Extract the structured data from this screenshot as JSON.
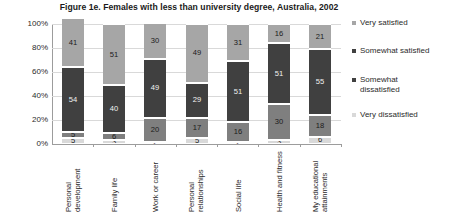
{
  "chart_data": {
    "type": "bar",
    "subtype": "stacked-bar-100-percent",
    "title": "Figure 1e. Females with less than university degree, Australia, 2002",
    "xlabel": "",
    "ylabel": "",
    "ylim": [
      0,
      100
    ],
    "yticks": [
      "0%",
      "20%",
      "40%",
      "60%",
      "80%",
      "100%"
    ],
    "ytick_values": [
      0,
      20,
      40,
      60,
      80,
      100
    ],
    "grid": true,
    "legend_position": "right",
    "categories": [
      "Personal\ndevelopment",
      "Family life",
      "Work or career",
      "Personal\nrelationships",
      "Social life",
      "Health and fitness",
      "My educational\nattainments"
    ],
    "series": [
      {
        "name": "Very satisfied",
        "color": "#a6a6a6",
        "values": [
          41,
          51,
          30,
          49,
          31,
          16,
          21
        ]
      },
      {
        "name": "Somewhat satisfied",
        "color": "#404040",
        "values": [
          54,
          40,
          49,
          29,
          51,
          51,
          55
        ]
      },
      {
        "name": "Somewhat dissatisfied",
        "color": "#7f7f7f",
        "values": [
          5,
          6,
          20,
          17,
          16,
          30,
          18
        ]
      },
      {
        "name": "Very dissatisfied",
        "color": "#d9d9d9",
        "values": [
          5,
          3,
          2,
          5,
          2,
          3,
          6
        ]
      }
    ]
  },
  "legend": {
    "entries": [
      {
        "label": "Very satisfied",
        "color": "#a6a6a6"
      },
      {
        "label": "Somewhat satisfied",
        "color": "#404040"
      },
      {
        "label": "Somewhat\ndissatisfied",
        "color": "#404040"
      },
      {
        "label": "Very dissatisfied",
        "color": "#d9d9d9"
      }
    ]
  }
}
